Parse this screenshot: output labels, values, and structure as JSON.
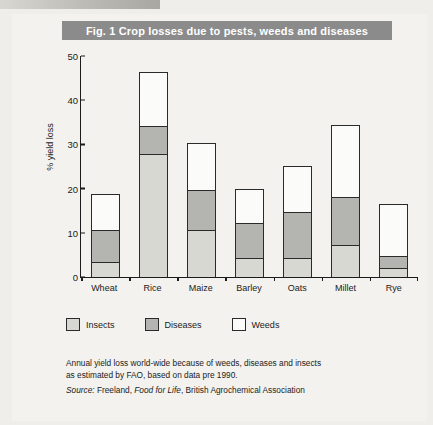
{
  "figure": {
    "title": "Fig. 1  Crop losses due to pests, weeds and diseases",
    "caption_line1": "Annual yield loss world-wide because of weeds, diseases and insects",
    "caption_line2": "as estimated by FAO, based on data pre 1990.",
    "source_prefix": "Source:",
    "source_author": "Freeland,",
    "source_work": "Food for Life",
    "source_publisher": ", British Agrochemical Association"
  },
  "colors": {
    "banner": "#8b8b8b",
    "banner_text": "#ffffff",
    "insects": "#d8d8d3",
    "diseases": "#b4b4b0",
    "weeds": "#fbfbf9",
    "outline": "#2a2a2a",
    "page": "#f3f2ee"
  },
  "chart_data": {
    "type": "bar",
    "subtype": "stacked",
    "title": "Fig. 1  Crop losses due to pests, weeds and diseases",
    "xlabel": "",
    "ylabel": "% yield loss",
    "ylim": [
      0,
      50
    ],
    "yticks": [
      0,
      10,
      20,
      30,
      40,
      50
    ],
    "grid": false,
    "legend_position": "below-axis",
    "categories": [
      "Wheat",
      "Rice",
      "Maize",
      "Barley",
      "Oats",
      "Millet",
      "Rye"
    ],
    "series": [
      {
        "name": "Insects",
        "values": [
          3.4,
          27.9,
          10.7,
          4.3,
          4.3,
          7.3,
          2.0
        ]
      },
      {
        "name": "Diseases",
        "values": [
          7.3,
          6.2,
          9.1,
          8.0,
          10.5,
          10.7,
          2.7
        ]
      },
      {
        "name": "Weeds",
        "values": [
          7.8,
          12.1,
          10.3,
          7.3,
          10.0,
          16.2,
          11.7
        ]
      }
    ],
    "totals": [
      18.5,
      46.2,
      30.1,
      19.6,
      24.8,
      34.2,
      16.4
    ]
  },
  "legend": [
    {
      "label": "Insects",
      "swatch": "#d8d8d3"
    },
    {
      "label": "Diseases",
      "swatch": "#b4b4b0"
    },
    {
      "label": "Weeds",
      "swatch": "#fbfbf9"
    }
  ]
}
